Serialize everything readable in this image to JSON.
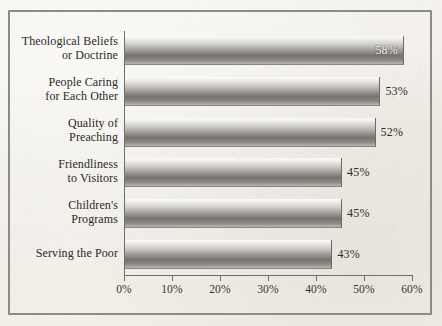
{
  "chart_data": {
    "type": "bar",
    "orientation": "horizontal",
    "title": "",
    "xlabel": "",
    "ylabel": "",
    "categories": [
      "Theological Beliefs or Doctrine",
      "People Caring for Each Other",
      "Quality of Preaching",
      "Friendliness to Visitors",
      "Children's Programs",
      "Serving the Poor"
    ],
    "category_lines": [
      [
        "Theological Beliefs",
        "or Doctrine"
      ],
      [
        "People Caring",
        "for Each Other"
      ],
      [
        "Quality of",
        "Preaching"
      ],
      [
        "Friendliness",
        "to Visitors"
      ],
      [
        "Children's",
        "Programs"
      ],
      [
        "Serving the Poor"
      ]
    ],
    "values": [
      58,
      53,
      52,
      45,
      45,
      43
    ],
    "value_labels": [
      "58%",
      "53%",
      "52%",
      "45%",
      "45%",
      "43%"
    ],
    "value_label_position": [
      "inside",
      "outside",
      "outside",
      "outside",
      "outside",
      "outside"
    ],
    "xlim": [
      0,
      60
    ],
    "xticks": [
      0,
      10,
      20,
      30,
      40,
      50,
      60
    ],
    "xtick_labels": [
      "0%",
      "10%",
      "20%",
      "30%",
      "40%",
      "50%",
      "60%"
    ],
    "grid": false,
    "legend": false,
    "bar_fill": "#9d9a95",
    "axis_color": "#6f6d69",
    "text_color": "#2b2926",
    "background": "#f2f0ec"
  }
}
